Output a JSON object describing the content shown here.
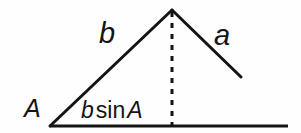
{
  "figure": {
    "background_color": "#fefefe",
    "stroke_color": "#141414",
    "labels": {
      "angle_A": "A",
      "side_b": "b",
      "side_a": "a",
      "altitude_expression": {
        "variable": "b",
        "function": "sin",
        "argument": "A",
        "full_text": "b sin A"
      }
    },
    "geometry": {
      "apex": {
        "x": 172,
        "y": 10
      },
      "left_vertex": {
        "x": 50,
        "y": 126
      },
      "side_a_endpoint": {
        "x": 241,
        "y": 77
      },
      "baseline_start": {
        "x": 50,
        "y": 126
      },
      "baseline_end": {
        "x": 288,
        "y": 126
      },
      "altitude_foot": {
        "x": 172,
        "y": 126
      },
      "stroke_width": 3,
      "altitude_dash_pattern": "5 6"
    }
  }
}
